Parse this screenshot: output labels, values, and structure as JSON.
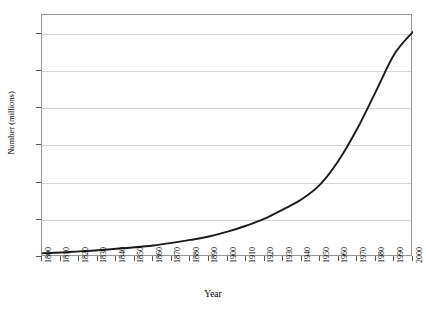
{
  "chart_data": {
    "type": "line",
    "title": "",
    "title_faint_cutoff": "",
    "xlabel": "Year",
    "ylabel": "Number (millions)",
    "xlim": [
      1800,
      2000
    ],
    "ylim": [
      0,
      65
    ],
    "y_ticks": [
      0,
      10,
      20,
      30,
      40,
      50,
      60
    ],
    "x_ticks": [
      1800,
      1810,
      1820,
      1830,
      1840,
      1850,
      1860,
      1870,
      1880,
      1890,
      1900,
      1910,
      1920,
      1930,
      1940,
      1950,
      1960,
      1970,
      1980,
      1990,
      2000
    ],
    "grid": "horizontal",
    "legend": "none",
    "series": [
      {
        "name": "Number (millions)",
        "color": "#1a1a1a",
        "x": [
          1800,
          1810,
          1820,
          1830,
          1840,
          1850,
          1860,
          1870,
          1880,
          1890,
          1900,
          1910,
          1920,
          1930,
          1940,
          1950,
          1960,
          1970,
          1980,
          1990,
          2000
        ],
        "values": [
          1.0,
          1.2,
          1.5,
          1.8,
          2.2,
          2.6,
          3.1,
          3.8,
          4.6,
          5.5,
          6.8,
          8.4,
          10.3,
          12.8,
          15.5,
          19.5,
          26.0,
          34.5,
          44.5,
          54.5,
          60.5
        ]
      }
    ],
    "axis_ranges": {
      "x": [
        1800,
        2000
      ],
      "y": [
        0,
        65
      ]
    },
    "colors": {
      "line": "#1a1a1a",
      "grid": "#d4d4d4",
      "frame": "#969696",
      "tick": "#555555",
      "text": "#000000",
      "background": "#ffffff"
    }
  },
  "axes": {
    "y_tick_labels": [
      "0",
      "10",
      "20",
      "30",
      "40",
      "50",
      "60"
    ],
    "x_tick_labels": [
      "1800",
      "1810",
      "1820",
      "1830",
      "1840",
      "1850",
      "1860",
      "1870",
      "1880",
      "1890",
      "1900",
      "1910",
      "1920",
      "1930",
      "1940",
      "1950",
      "1960",
      "1970",
      "1980",
      "1990",
      "2000"
    ],
    "x_title": "Year",
    "y_title": "Number (millions)"
  }
}
